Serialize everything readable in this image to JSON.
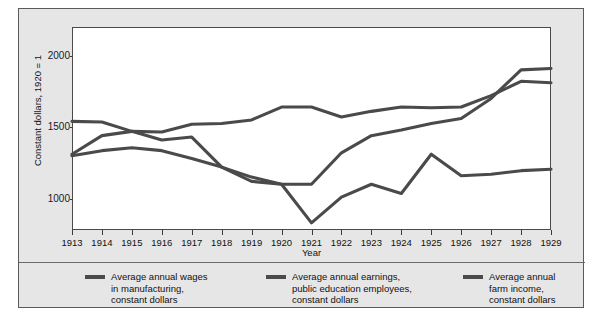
{
  "figure": {
    "y_axis_title": "Constant dollars, 1920 = 1",
    "x_axis_title": "Year"
  },
  "legend": {
    "items": [
      {
        "label": "Average annual wages\nin manufacturing,\nconstant dollars",
        "color": "#4a4a4a"
      },
      {
        "label": "Average annual earnings,\npublic education employees,\nconstant dollars",
        "color": "#4a4a4a"
      },
      {
        "label": "Average annual\nfarm income,\nconstant dollars",
        "color": "#4a4a4a"
      }
    ]
  },
  "chart_data": {
    "type": "line",
    "title": "",
    "xlabel": "Year",
    "ylabel": "Constant dollars, 1920 = 1",
    "x": [
      1913,
      1914,
      1915,
      1916,
      1917,
      1918,
      1919,
      1920,
      1921,
      1922,
      1923,
      1924,
      1925,
      1926,
      1927,
      1928,
      1929
    ],
    "xlim": [
      1913,
      1929
    ],
    "ylim": [
      640,
      2060
    ],
    "yticks": [
      1000,
      1500,
      2000
    ],
    "ytick_labels": [
      "1000",
      "2000",
      "1500"
    ],
    "xtick_labels": [
      "1913",
      "1914",
      "1915",
      "1916",
      "1917",
      "1918",
      "1919",
      "1920",
      "1921",
      "1922",
      "1923",
      "1924",
      "1925",
      "1926",
      "1927",
      "1928",
      "1929"
    ],
    "grid": false,
    "legend_position": "below-plot",
    "series": [
      {
        "name": "Average annual wages in manufacturing, constant dollars",
        "color": "#4a4a4a",
        "values": [
          1400,
          1395,
          1330,
          1325,
          1380,
          1385,
          1410,
          1500,
          1500,
          1430,
          1470,
          1500,
          1495,
          1500,
          1580,
          1680,
          1670
        ]
      },
      {
        "name": "Average annual earnings, public education employees, constant dollars",
        "color": "#4a4a4a",
        "values": [
          1170,
          1300,
          1330,
          1270,
          1290,
          1080,
          980,
          960,
          960,
          1180,
          1300,
          1340,
          1385,
          1420,
          1560,
          1760,
          1770
        ]
      },
      {
        "name": "Average annual farm income, constant dollars",
        "color": "#4a4a4a",
        "values": [
          1160,
          1195,
          1215,
          1195,
          1140,
          1080,
          1010,
          960,
          690,
          870,
          960,
          895,
          1170,
          1020,
          1030,
          1055,
          1065
        ]
      }
    ]
  }
}
